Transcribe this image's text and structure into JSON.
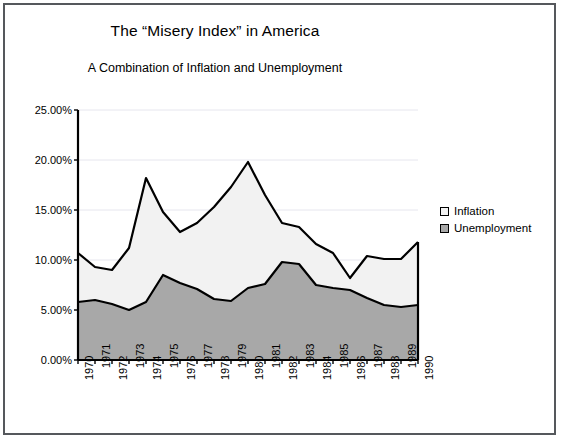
{
  "figure": {
    "title": "The “Misery Index” in America",
    "subtitle": "A Combination of Inflation and Unemployment"
  },
  "legend": {
    "position": "right",
    "items": [
      {
        "label": "Inflation",
        "color": "#f2f2f2",
        "swatch": "inflation-swatch"
      },
      {
        "label": "Unemployment",
        "color": "#a8a8a8",
        "swatch": "unemployment-swatch"
      }
    ]
  },
  "axes": {
    "y_ticks": [
      "0.00%",
      "5.00%",
      "10.00%",
      "15.00%",
      "20.00%",
      "25.00%"
    ],
    "x_ticks": [
      "1970",
      "1971",
      "1972",
      "1973",
      "1974",
      "1975",
      "1976",
      "1977",
      "1978",
      "1979",
      "1980",
      "1981",
      "1982",
      "1983",
      "1984",
      "1985",
      "1986",
      "1987",
      "1988",
      "1989",
      "1990"
    ]
  },
  "chart_data": {
    "type": "area",
    "stacked": true,
    "title": "The “Misery Index” in America",
    "subtitle": "A Combination of Inflation and Unemployment",
    "xlabel": "",
    "ylabel": "",
    "grid": true,
    "ylim": [
      0,
      25
    ],
    "ytick_values": [
      0,
      5,
      10,
      15,
      20,
      25
    ],
    "ytick_labels": [
      "0.00%",
      "5.00%",
      "10.00%",
      "15.00%",
      "20.00%",
      "25.00%"
    ],
    "y_unit": "percent",
    "categories": [
      "1970",
      "1971",
      "1972",
      "1973",
      "1974",
      "1975",
      "1976",
      "1977",
      "1978",
      "1979",
      "1980",
      "1981",
      "1982",
      "1983",
      "1984",
      "1985",
      "1986",
      "1987",
      "1988",
      "1989",
      "1990"
    ],
    "series": [
      {
        "name": "Unemployment",
        "color": "#a8a8a8",
        "values": [
          5.8,
          6.0,
          5.6,
          5.0,
          5.8,
          8.5,
          7.7,
          7.1,
          6.1,
          5.9,
          7.2,
          7.6,
          9.8,
          9.6,
          7.5,
          7.2,
          7.0,
          6.2,
          5.5,
          5.3,
          5.5
        ]
      },
      {
        "name": "Inflation",
        "color": "#f2f2f2",
        "values": [
          4.9,
          3.3,
          3.4,
          6.2,
          12.4,
          6.3,
          5.1,
          6.6,
          9.2,
          11.4,
          12.6,
          8.9,
          3.9,
          3.7,
          4.1,
          3.5,
          1.2,
          4.2,
          4.6,
          4.8,
          6.3
        ]
      }
    ],
    "totals": [
      10.7,
      9.3,
      9.0,
      11.2,
      18.2,
      14.8,
      12.8,
      13.7,
      15.3,
      17.3,
      19.8,
      16.5,
      13.7,
      13.3,
      11.6,
      10.7,
      8.2,
      10.4,
      10.1,
      10.1,
      11.8
    ]
  },
  "style": {
    "frame_color": "#55585c",
    "axis_color": "#000000",
    "grid_color": "#e6e6ee",
    "plot_background": "#ffffff"
  }
}
